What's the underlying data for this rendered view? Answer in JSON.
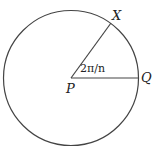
{
  "diagram": {
    "type": "circle-sector",
    "points": {
      "center": {
        "label": "P"
      },
      "point_x": {
        "label": "X"
      },
      "point_q": {
        "label": "Q"
      }
    },
    "angle_label": "2π/n",
    "stroke_color": "#333333"
  }
}
